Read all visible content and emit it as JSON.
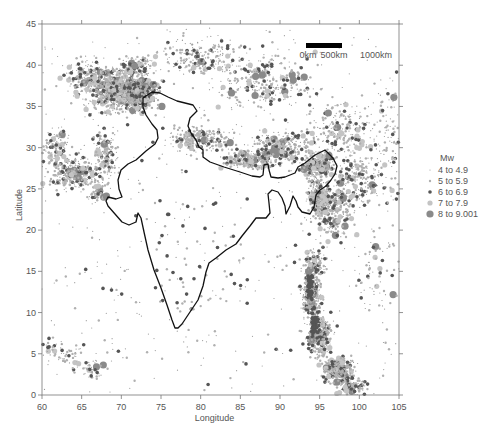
{
  "map": {
    "type": "earthquake_epicenter_map",
    "region": "India and surroundings",
    "x_axis": {
      "title": "Longitude",
      "min": 60,
      "max": 105,
      "ticks": [
        "60",
        "65",
        "70",
        "75",
        "80",
        "85",
        "90",
        "95",
        "100",
        "105"
      ]
    },
    "y_axis": {
      "title": "Latitude",
      "min": 0,
      "max": 45,
      "ticks": [
        "0",
        "5",
        "10",
        "15",
        "20",
        "25",
        "30",
        "35",
        "40",
        "45"
      ]
    },
    "scale_bar": {
      "labels": [
        "0km",
        "500km",
        "1000km"
      ]
    },
    "legend": {
      "title": "Mw",
      "items": [
        {
          "label": "4  to  4.9",
          "size": 0.6,
          "color": "#9a9a9a"
        },
        {
          "label": "5  to  5.9",
          "size": 1.2,
          "color": "#b0b0b0"
        },
        {
          "label": "6  to  6.9",
          "size": 1.8,
          "color": "#555555"
        },
        {
          "label": "7  to  7.9",
          "size": 2.6,
          "color": "#c4c4c4"
        },
        {
          "label": "8  to  9.001",
          "size": 3.6,
          "color": "#8a8a8a"
        }
      ]
    },
    "outline_color": "#111111"
  }
}
